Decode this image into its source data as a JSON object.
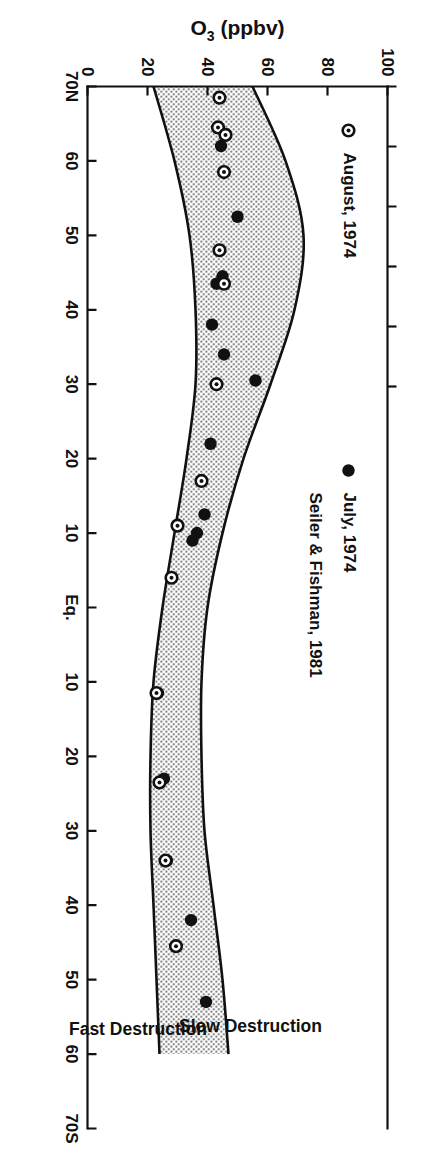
{
  "figure": {
    "legend": {
      "items": [
        {
          "marker": "open-circle-dot-marker",
          "label": "August, 1974"
        },
        {
          "marker": "filled-circle-marker",
          "label": "July, 1974"
        }
      ],
      "source_label": "Seiler & Fishman, 1981"
    },
    "band_labels": {
      "upper": "Slow Destruction",
      "lower": "Fast Destruction"
    }
  },
  "chart_data": {
    "type": "scatter",
    "title": "",
    "xlabel": "",
    "ylabel": "O",
    "ylabel_sub": "3",
    "ylabel_units": " (ppbv)",
    "grid": false,
    "legend_position": "top-left",
    "x_axis": {
      "name": "latitude",
      "tick_labels": [
        "70N",
        "60",
        "50",
        "40",
        "30",
        "20",
        "10",
        "Eq.",
        "10",
        "20",
        "30",
        "40",
        "50",
        "60",
        "70S"
      ],
      "tick_values": [
        70,
        60,
        50,
        40,
        30,
        20,
        10,
        0,
        -10,
        -20,
        -30,
        -40,
        -50,
        -60,
        -70
      ],
      "range": [
        70,
        -70
      ]
    },
    "y_axis": {
      "name": "O3 mixing ratio",
      "tick_labels": [
        "0",
        "20",
        "40",
        "60",
        "80",
        "100"
      ],
      "tick_values": [
        0,
        20,
        40,
        60,
        80,
        100
      ],
      "range": [
        0,
        100
      ]
    },
    "series": [
      {
        "name": "July, 1974",
        "marker": "filled-circle",
        "points": [
          {
            "lat": 62.0,
            "o3": 44.5
          },
          {
            "lat": 52.5,
            "o3": 50.0
          },
          {
            "lat": 44.5,
            "o3": 45.0
          },
          {
            "lat": 43.5,
            "o3": 43.0
          },
          {
            "lat": 38.0,
            "o3": 41.5
          },
          {
            "lat": 34.0,
            "o3": 45.5
          },
          {
            "lat": 30.5,
            "o3": 56.0
          },
          {
            "lat": 22.0,
            "o3": 41.0
          },
          {
            "lat": 12.5,
            "o3": 39.0
          },
          {
            "lat": 10.0,
            "o3": 36.5
          },
          {
            "lat": 9.0,
            "o3": 35.0
          },
          {
            "lat": -11.5,
            "o3": 23.5
          },
          {
            "lat": -23.0,
            "o3": 25.5
          },
          {
            "lat": -23.5,
            "o3": 24.0
          },
          {
            "lat": -34.0,
            "o3": 26.5
          },
          {
            "lat": -42.0,
            "o3": 34.5
          },
          {
            "lat": -53.0,
            "o3": 39.5
          }
        ]
      },
      {
        "name": "August, 1974",
        "marker": "open-circle-dot",
        "points": [
          {
            "lat": 68.5,
            "o3": 44.0
          },
          {
            "lat": 64.5,
            "o3": 43.5
          },
          {
            "lat": 63.5,
            "o3": 46.0
          },
          {
            "lat": 58.5,
            "o3": 45.5
          },
          {
            "lat": 48.0,
            "o3": 44.0
          },
          {
            "lat": 43.5,
            "o3": 45.5
          },
          {
            "lat": 30.0,
            "o3": 43.0
          },
          {
            "lat": 17.0,
            "o3": 38.0
          },
          {
            "lat": 11.0,
            "o3": 30.0
          },
          {
            "lat": 4.0,
            "o3": 28.0
          },
          {
            "lat": -11.5,
            "o3": 23.0
          },
          {
            "lat": -23.5,
            "o3": 24.0
          },
          {
            "lat": -34.0,
            "o3": 26.0
          },
          {
            "lat": -45.5,
            "o3": 29.5
          }
        ]
      }
    ],
    "band": {
      "name": "Seiler & Fishman, 1981 envelope",
      "upper_label": "Slow Destruction",
      "lower_label": "Fast Destruction",
      "upper": [
        {
          "lat": 70,
          "o3": 55
        },
        {
          "lat": 60,
          "o3": 66
        },
        {
          "lat": 50,
          "o3": 72
        },
        {
          "lat": 40,
          "o3": 69
        },
        {
          "lat": 30,
          "o3": 61
        },
        {
          "lat": 20,
          "o3": 52
        },
        {
          "lat": 10,
          "o3": 45
        },
        {
          "lat": 0,
          "o3": 40
        },
        {
          "lat": -10,
          "o3": 38
        },
        {
          "lat": -20,
          "o3": 38
        },
        {
          "lat": -30,
          "o3": 39
        },
        {
          "lat": -40,
          "o3": 42
        },
        {
          "lat": -50,
          "o3": 45
        },
        {
          "lat": -60,
          "o3": 47
        }
      ],
      "lower": [
        {
          "lat": 70,
          "o3": 22
        },
        {
          "lat": 60,
          "o3": 29
        },
        {
          "lat": 50,
          "o3": 34
        },
        {
          "lat": 40,
          "o3": 36
        },
        {
          "lat": 30,
          "o3": 36
        },
        {
          "lat": 20,
          "o3": 33
        },
        {
          "lat": 10,
          "o3": 29
        },
        {
          "lat": 0,
          "o3": 25
        },
        {
          "lat": -10,
          "o3": 22
        },
        {
          "lat": -20,
          "o3": 21
        },
        {
          "lat": -30,
          "o3": 21
        },
        {
          "lat": -40,
          "o3": 22
        },
        {
          "lat": -50,
          "o3": 23
        },
        {
          "lat": -60,
          "o3": 24
        }
      ]
    }
  }
}
